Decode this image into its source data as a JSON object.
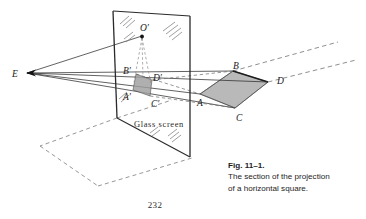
{
  "figure": {
    "caption_title": "Fig. 11–1.",
    "caption_line1": "The section of the projection",
    "caption_line2": "of a horizontal square.",
    "screen_label": "Glass screen",
    "folio": "232",
    "labels": {
      "eye": "E",
      "center_image": "O′",
      "b_prime": "B′",
      "d_prime": "D′",
      "a_prime": "A′",
      "c_prime": "C′",
      "b": "B",
      "d": "D",
      "a": "A",
      "c": "C"
    },
    "colors": {
      "ink": "#1a1a1a",
      "line": "#3a3a3a",
      "dash": "#5a5a5a",
      "square_fill": "#a8a8a8",
      "image_fill": "#9a9a9a",
      "background": "#ffffff"
    },
    "geometry": {
      "eye_point": [
        27,
        73
      ],
      "screen_corners": [
        [
          113,
          11
        ],
        [
          190,
          16
        ],
        [
          190,
          157
        ],
        [
          117,
          118
        ]
      ],
      "square_ABCD": {
        "A": [
          200,
          94
        ],
        "B": [
          233,
          71
        ],
        "C": [
          235,
          108
        ],
        "D": [
          268,
          82
        ]
      },
      "square_image": {
        "A_prime": [
          133,
          90
        ],
        "B_prime": [
          136,
          74
        ],
        "C_prime": [
          150,
          96
        ],
        "D_prime": [
          152,
          80
        ]
      },
      "O_prime": [
        142,
        34
      ]
    }
  }
}
